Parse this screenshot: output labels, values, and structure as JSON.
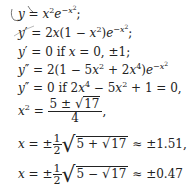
{
  "lines": [
    {
      "id": "l1",
      "text": "y = x²e^(−x²);"
    },
    {
      "id": "l2",
      "text": "y′ = 2x(1 − x²)e^(−x²);"
    },
    {
      "id": "l3",
      "text": "y′ = 0 if x = 0, ±1;"
    },
    {
      "id": "l4",
      "text": "y″ = 2(1 − 5x² + 2x⁴)e^(−x²)"
    },
    {
      "id": "l5",
      "text": "y″ = 0 if 2x⁴ − 5x² + 1 = 0,"
    },
    {
      "id": "l6",
      "text": "x² = (5 ± √17)/4,"
    },
    {
      "id": "l7",
      "text": "x = ±(1/2)√(5 + √17) ≈ ±1.51,"
    },
    {
      "id": "l8",
      "text": "x = ±(1/2)√(5 − √17) ≈ ±0.47"
    }
  ],
  "parts": {
    "if": "if",
    "l3_vals": "0, ±1;",
    "l5_eq": "+ 1 = 0,",
    "frac_num": "5 ± ",
    "sqrt17": "17",
    "frac_den": "4",
    "half_num": "1",
    "half_den": "2",
    "approx1": "≈ ±1.51,",
    "approx2": "≈ ±0.47"
  }
}
